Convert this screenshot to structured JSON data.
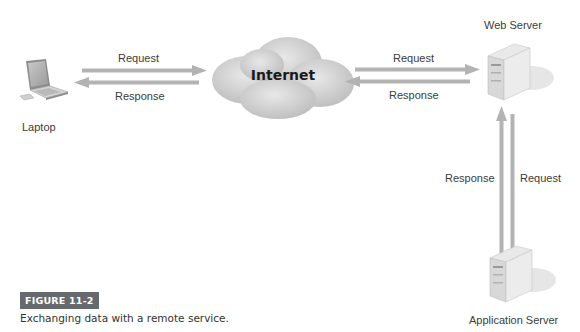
{
  "diagram": {
    "nodes": {
      "laptop": {
        "label": "Laptop",
        "icon": "laptop-icon"
      },
      "internet": {
        "label": "Internet",
        "icon": "cloud-icon"
      },
      "web_server": {
        "label": "Web Server",
        "icon": "server-icon"
      },
      "app_server": {
        "label": "Application Server",
        "icon": "server-icon"
      }
    },
    "edges": {
      "laptop_internet_request": "Request",
      "laptop_internet_response": "Response",
      "internet_web_request": "Request",
      "internet_web_response": "Response",
      "web_app_response": "Response",
      "web_app_request": "Request"
    },
    "colors": {
      "arrow": "#b3b3b3",
      "cloud": "#cfcfcf",
      "badge_bg": "#666a6e"
    }
  },
  "figure": {
    "badge": "FIGURE 11-2",
    "caption": "Exchanging data with a remote service."
  }
}
